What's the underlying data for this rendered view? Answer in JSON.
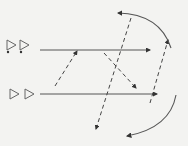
{
  "diagram": {
    "background": "#f3f3f1",
    "stroke_color": "#555555",
    "dash_color": "#444444",
    "rows": [
      {
        "id": "top",
        "triangles": [
          {
            "x": 11,
            "y": 45,
            "dot": true
          },
          {
            "x": 24,
            "y": 45,
            "dot": true
          }
        ],
        "line": {
          "x1": 40,
          "y1": 50,
          "x2": 150,
          "y2": 50
        }
      },
      {
        "id": "bottom",
        "triangles": [
          {
            "x": 14,
            "y": 94,
            "dot": false
          },
          {
            "x": 29,
            "y": 94,
            "dot": false
          }
        ],
        "line": {
          "x1": 40,
          "y1": 94,
          "x2": 157,
          "y2": 94
        }
      }
    ],
    "dashed_arrows": [
      {
        "from": [
          55,
          86
        ],
        "to": [
          77,
          51
        ]
      },
      {
        "from": [
          104,
          53
        ],
        "to": [
          136,
          88
        ]
      },
      {
        "from": [
          131,
          18
        ],
        "to": [
          96,
          129
        ]
      },
      {
        "from": [
          150,
          103
        ],
        "to": [
          168,
          40
        ]
      }
    ],
    "arcs": [
      {
        "id": "upper-arc",
        "path": "M 171 48 Q 160 14 118 13"
      },
      {
        "id": "lower-arc",
        "path": "M 176 95 Q 170 128 127 136"
      }
    ]
  }
}
